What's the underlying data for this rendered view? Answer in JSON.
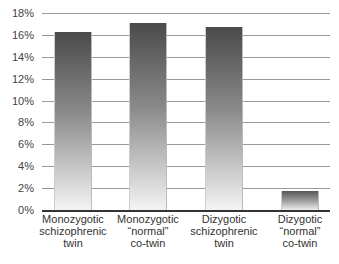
{
  "chart_data": {
    "type": "bar",
    "title": "",
    "xlabel": "",
    "ylabel": "",
    "categories": [
      "Monozygotic schizophrenic twin",
      "Monozygotic “normal” co-twin",
      "Dizygotic schizophrenic twin",
      "Dizygotic “normal” co-twin"
    ],
    "category_lines": [
      [
        "Monozygotic",
        "schizophrenic",
        "twin"
      ],
      [
        "Monozygotic",
        "“normal”",
        "co-twin"
      ],
      [
        "Dizygotic",
        "schizophrenic",
        "twin"
      ],
      [
        "Dizygotic",
        "“normal”",
        "co-twin"
      ]
    ],
    "values": [
      16.3,
      17.1,
      16.7,
      1.7
    ],
    "unit": "%",
    "ylim": [
      0,
      18
    ],
    "yticks": [
      "0%",
      "2%",
      "4%",
      "6%",
      "8%",
      "10%",
      "12%",
      "14%",
      "16%",
      "18%"
    ],
    "grid": true,
    "legend": null,
    "caption_partial": "(cut-off caption text at bottom edge)"
  }
}
